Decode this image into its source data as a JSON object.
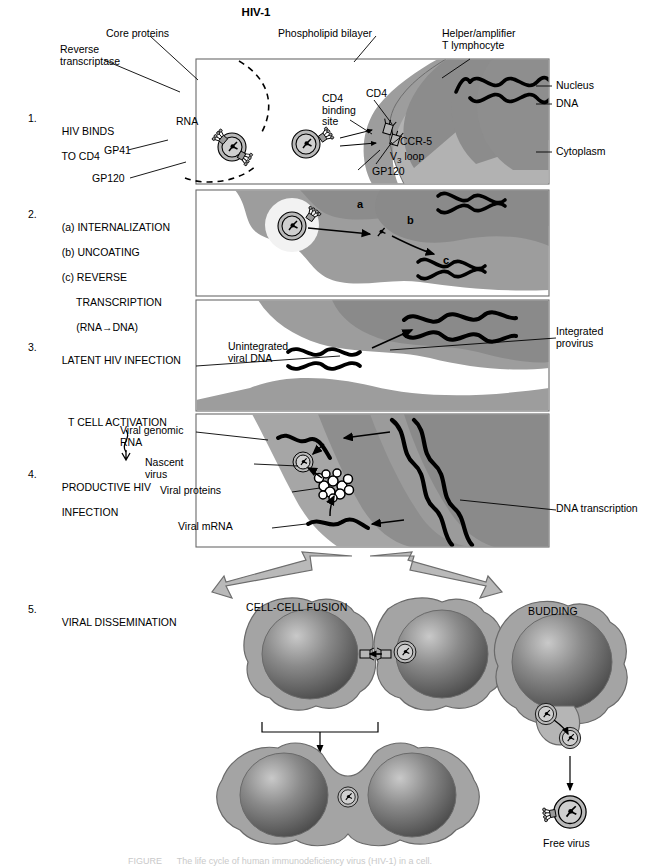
{
  "figure": {
    "title": "HIV-1",
    "caption": "FIGURE      The life cycle of human immunodeficiency virus (HIV-1) in a cell."
  },
  "colors": {
    "cell_cytoplasm": "#a8a8a8",
    "cell_nucleus": "#8d8d8d",
    "cell_light": "#c4c4c4",
    "virus_envelope": "#b4b4b4",
    "virus_core": "#d2d2d2",
    "panel_border": "#555555",
    "outline": "#000000",
    "arrow_gray": "#a0a0a0",
    "background": "#ffffff"
  },
  "steps": [
    {
      "num": "1.",
      "lines": [
        "HIV BINDS",
        "TO CD4"
      ]
    },
    {
      "num": "2.",
      "lines": [
        "(a) INTERNALIZATION",
        "(b) UNCOATING",
        "(c) REVERSE",
        "     TRANSCRIPTION",
        "     (RNA→DNA)"
      ]
    },
    {
      "num": "3.",
      "lines": [
        "LATENT HIV INFECTION"
      ]
    },
    {
      "num": "4.",
      "lines": [
        "PRODUCTIVE HIV",
        "INFECTION"
      ]
    },
    {
      "num": "5.",
      "lines": [
        "VIRAL DISSEMINATION"
      ]
    }
  ],
  "activation": {
    "label": "T CELL ACTIVATION"
  },
  "panel1": {
    "labels": {
      "core_proteins": "Core proteins",
      "reverse_transcriptase": "Reverse\ntranscriptase",
      "rna": "RNA",
      "gp41": "GP41",
      "gp120": "GP120",
      "phospholipid_bilayer": "Phospholipid bilayer",
      "helper_amplifier": "Helper/amplifier\nT lymphocyte",
      "cd4_binding_site": "CD4\nbinding\nsite",
      "cd4": "CD4",
      "ccr5": "CCR-5",
      "v3_loop_pre": "V",
      "v3_loop_sub": "3",
      "v3_loop_post": " loop",
      "gp120_cell": "GP120",
      "nucleus": "Nucleus",
      "dna": "DNA",
      "cytoplasm": "Cytoplasm"
    }
  },
  "panel2": {
    "markers": {
      "a": "a",
      "b": "b",
      "c": "c"
    }
  },
  "panel3": {
    "labels": {
      "unintegrated_viral_dna": "Unintegrated\nviral DNA",
      "integrated_provirus": "Integrated\nprovirus"
    }
  },
  "panel4": {
    "labels": {
      "viral_genomic_rna": "Viral genomic\nRNA",
      "nascent_virus": "Nascent\nvirus",
      "viral_proteins": "Viral proteins",
      "viral_mrna": "Viral mRNA",
      "dna_transcription": "DNA transcription"
    }
  },
  "panel5": {
    "headings": {
      "fusion": "CELL-CELL FUSION",
      "budding": "BUDDING"
    },
    "labels": {
      "free_virus": "Free virus"
    }
  }
}
